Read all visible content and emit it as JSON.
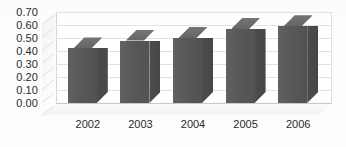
{
  "chart_data": {
    "type": "bar",
    "title": "",
    "subtitle": "",
    "xlabel": "",
    "ylabel": "",
    "categories": [
      "2002",
      "2003",
      "2004",
      "2005",
      "2006"
    ],
    "values": [
      0.42,
      0.48,
      0.5,
      0.57,
      0.59
    ],
    "series": [
      {
        "name": "",
        "values": [
          0.42,
          0.48,
          0.5,
          0.57,
          0.59
        ]
      }
    ],
    "ylim": [
      0.0,
      0.7
    ],
    "ytick_labels": [
      "0.70",
      "0.60",
      "0.50",
      "0.40",
      "0.30",
      "0.20",
      "0.10",
      "0.00"
    ],
    "ytick_values": [
      0.7,
      0.6,
      0.5,
      0.4,
      0.3,
      0.2,
      0.1,
      0.0
    ],
    "ytick_step": 0.1,
    "grid": true,
    "grid_axis": "y",
    "legend": false,
    "legend_position": "none",
    "three_d": true,
    "annotations": [],
    "colors": {
      "bar_front": "#585858",
      "bar_side": "#4a4a4a",
      "bar_top": "#6b6b6b",
      "gridline": "#e2e2e2",
      "baseline": "#c9c9c9",
      "plot_background": "#ffffff",
      "wall": "#f5f5f5",
      "text": "#2b2b2b"
    }
  }
}
